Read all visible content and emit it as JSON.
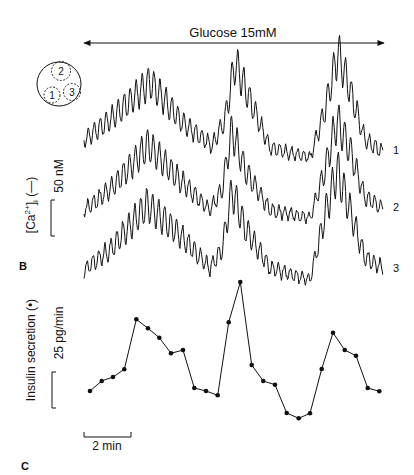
{
  "figure": {
    "stimulus_label": "Glucose 15mM",
    "panel_b_label": "B",
    "panel_c_label": "C",
    "islet_regions": [
      "1",
      "2",
      "3"
    ],
    "ca_axis_label": "[Ca2+]i (—)",
    "ca_scale_label": "50 nM",
    "insulin_axis_label": "Insulin secretion (•)",
    "insulin_scale_label": "25 pg/min",
    "time_scale_label": "2 min",
    "trace_labels": [
      "1",
      "2",
      "3"
    ],
    "colors": {
      "trace": "#111111",
      "background": "#ffffff"
    }
  },
  "chart_data": [
    {
      "type": "line",
      "title": "Intracellular Ca2+ oscillations in three islet regions (Glucose 15mM)",
      "ylabel": "[Ca2+]i",
      "scale_bar_y": "50 nM",
      "scale_bar_x": "2 min",
      "series": [
        {
          "name": "1",
          "envelope_px": [
            [
              84,
              140
            ],
            [
              110,
              120
            ],
            [
              150,
              82
            ],
            [
              180,
              120
            ],
            [
              212,
              146
            ],
            [
              225,
              120
            ],
            [
              235,
              62
            ],
            [
              250,
              100
            ],
            [
              270,
              148
            ],
            [
              310,
              158
            ],
            [
              325,
              110
            ],
            [
              338,
              52
            ],
            [
              350,
              90
            ],
            [
              365,
              140
            ],
            [
              383,
              152
            ]
          ]
        },
        {
          "name": "2",
          "envelope_px": [
            [
              84,
              210
            ],
            [
              110,
              190
            ],
            [
              148,
              145
            ],
            [
              175,
              175
            ],
            [
              210,
              210
            ],
            [
              222,
              190
            ],
            [
              232,
              130
            ],
            [
              245,
              170
            ],
            [
              270,
              210
            ],
            [
              310,
              218
            ],
            [
              325,
              170
            ],
            [
              337,
              120
            ],
            [
              350,
              150
            ],
            [
              365,
              198
            ],
            [
              383,
              208
            ]
          ]
        },
        {
          "name": "3",
          "envelope_px": [
            [
              84,
              270
            ],
            [
              110,
              250
            ],
            [
              147,
              205
            ],
            [
              175,
              230
            ],
            [
              210,
              268
            ],
            [
              222,
              250
            ],
            [
              232,
              190
            ],
            [
              245,
              228
            ],
            [
              270,
              268
            ],
            [
              310,
              280
            ],
            [
              325,
              215
            ],
            [
              337,
              170
            ],
            [
              350,
              210
            ],
            [
              365,
              258
            ],
            [
              383,
              268
            ]
          ]
        }
      ],
      "notes": "Ca traces show fast oscillations superimposed on slow waves with three peaks; all three regions are synchronous."
    },
    {
      "type": "line",
      "title": "Insulin secretion",
      "ylabel": "Insulin secretion",
      "scale_bar_y": "25 pg/min",
      "scale_bar_x": "2 min",
      "x_px": [
        90,
        101.7,
        113,
        124.3,
        136.3,
        148,
        159.3,
        171,
        183,
        194.3,
        206,
        217.7,
        228.7,
        240.3,
        251.7,
        263.3,
        275,
        286.7,
        298.7,
        310,
        321.7,
        333,
        344.7,
        356,
        367.7,
        379.3
      ],
      "y_px": [
        391,
        381,
        377,
        369.3,
        319.3,
        328.3,
        337.7,
        353.3,
        350,
        388,
        391,
        395.3,
        322.3,
        282,
        365,
        381,
        384.7,
        413,
        418.3,
        413.3,
        369,
        332.7,
        350,
        355.7,
        388,
        391.3
      ],
      "values_pg_per_min_relative": [
        19,
        26,
        28,
        33,
        68,
        61,
        55,
        44,
        46,
        20,
        18,
        15,
        65,
        93,
        35,
        24,
        22,
        2,
        0,
        2,
        33,
        58,
        46,
        42,
        20,
        19
      ]
    }
  ]
}
